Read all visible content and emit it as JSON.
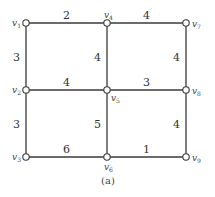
{
  "diagram": {
    "type": "weighted-graph",
    "caption": "(a)",
    "nodes": [
      {
        "id": "v1",
        "base": "v",
        "sub": "1",
        "row": 0,
        "col": 0,
        "label_side": "left"
      },
      {
        "id": "v4",
        "base": "v",
        "sub": "4",
        "row": 0,
        "col": 1,
        "label_side": "top"
      },
      {
        "id": "v7",
        "base": "v",
        "sub": "7",
        "row": 0,
        "col": 2,
        "label_side": "right"
      },
      {
        "id": "v2",
        "base": "v",
        "sub": "2",
        "row": 1,
        "col": 0,
        "label_side": "left"
      },
      {
        "id": "v5",
        "base": "v",
        "sub": "5",
        "row": 1,
        "col": 1,
        "label_side": "bottom-right"
      },
      {
        "id": "v8",
        "base": "v",
        "sub": "8",
        "row": 1,
        "col": 2,
        "label_side": "right"
      },
      {
        "id": "v3",
        "base": "v",
        "sub": "3",
        "row": 2,
        "col": 0,
        "label_side": "left"
      },
      {
        "id": "v6",
        "base": "v",
        "sub": "6",
        "row": 2,
        "col": 1,
        "label_side": "bottom"
      },
      {
        "id": "v9",
        "base": "v",
        "sub": "9",
        "row": 2,
        "col": 2,
        "label_side": "right"
      }
    ],
    "edges": [
      {
        "from": "v1",
        "to": "v4",
        "weight": "2"
      },
      {
        "from": "v4",
        "to": "v7",
        "weight": "4"
      },
      {
        "from": "v1",
        "to": "v2",
        "weight": "3"
      },
      {
        "from": "v4",
        "to": "v5",
        "weight": "4"
      },
      {
        "from": "v7",
        "to": "v8",
        "weight": "4"
      },
      {
        "from": "v2",
        "to": "v5",
        "weight": "4"
      },
      {
        "from": "v5",
        "to": "v8",
        "weight": "3"
      },
      {
        "from": "v2",
        "to": "v3",
        "weight": "3"
      },
      {
        "from": "v5",
        "to": "v6",
        "weight": "5"
      },
      {
        "from": "v8",
        "to": "v9",
        "weight": "4"
      },
      {
        "from": "v3",
        "to": "v6",
        "weight": "6"
      },
      {
        "from": "v6",
        "to": "v9",
        "weight": "1"
      }
    ]
  }
}
